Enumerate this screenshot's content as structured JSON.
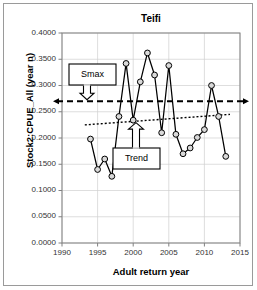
{
  "figure": {
    "title": "Teifi",
    "xlabel": "Adult return year",
    "ylabel": "Stock2:CPUE_All (year n)"
  },
  "annotations": {
    "smax": "Smax",
    "trend": "Trend"
  },
  "colors": {
    "series_line": "#000000",
    "marker_fill": "#d9d9d9",
    "marker_stroke": "#000000",
    "smax_line": "#000000",
    "trend_line": "#000000",
    "grid": "#d0d0d0",
    "axis": "#808080",
    "border": "#9a9a9a",
    "text": "#000000"
  },
  "chart_data": {
    "type": "line",
    "title": "Teifi",
    "xlabel": "Adult return year",
    "ylabel": "Stock2:CPUE_All (year n)",
    "xlim": [
      1990,
      2015
    ],
    "ylim": [
      0.0,
      0.4
    ],
    "xticks": [
      1990,
      1995,
      2000,
      2005,
      2010,
      2015
    ],
    "yticks": [
      0.0,
      0.05,
      0.1,
      0.15,
      0.2,
      0.25,
      0.3,
      0.35,
      0.4
    ],
    "ytick_labels": [
      "0.0000",
      "0.0500",
      "0.1000",
      "0.1500",
      "0.2000",
      "0.2500",
      "0.3000",
      "0.3500",
      "0.4000"
    ],
    "xtick_labels": [
      "1990",
      "1995",
      "2000",
      "2005",
      "2010",
      "2015"
    ],
    "grid": true,
    "legend": null,
    "series": [
      {
        "name": "Stock2:CPUE_All (year n)",
        "style": "line-markers",
        "x": [
          1994,
          1995,
          1996,
          1997,
          1998,
          1999,
          2000,
          2001,
          2002,
          2003,
          2004,
          2005,
          2006,
          2007,
          2008,
          2009,
          2010,
          2011,
          2012,
          2013
        ],
        "values": [
          0.198,
          0.14,
          0.16,
          0.127,
          0.241,
          0.342,
          0.234,
          0.307,
          0.362,
          0.32,
          0.21,
          0.338,
          0.207,
          0.17,
          0.181,
          0.201,
          0.216,
          0.3,
          0.241,
          0.165
        ]
      },
      {
        "name": "Smax",
        "style": "dashed-horizontal",
        "x": [
          1990,
          2015
        ],
        "values": [
          0.27,
          0.27
        ]
      },
      {
        "name": "Trend",
        "style": "dotted-linear",
        "x": [
          1993.2,
          2013.6
        ],
        "values": [
          0.225,
          0.245
        ]
      }
    ],
    "annotations": [
      {
        "text": "Smax",
        "points_to": "Smax dashed line at 0.270"
      },
      {
        "text": "Trend",
        "points_to": "Trend dotted regression line"
      }
    ]
  }
}
